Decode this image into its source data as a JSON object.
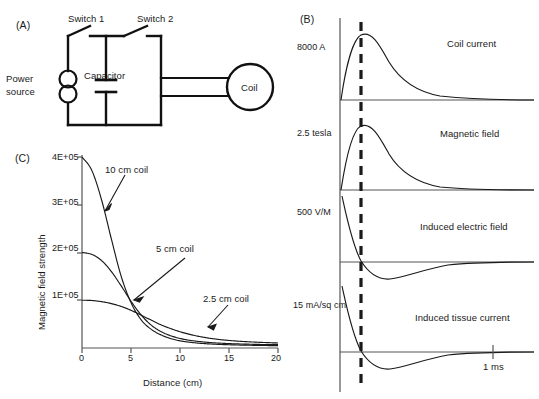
{
  "figure": {
    "panels": [
      {
        "id": "A",
        "label": "(A)"
      },
      {
        "id": "B",
        "label": "(B)"
      },
      {
        "id": "C",
        "label": "(C)"
      }
    ]
  },
  "panel_a": {
    "label": "(A)",
    "title": "TMS stimulator circuit diagram",
    "components": {
      "switch1": "Switch 1",
      "switch2": "Switch 2",
      "power_source": "Power",
      "power_source_line2": "source",
      "capacitor": "Capacitor",
      "coil": "Coil"
    }
  },
  "panel_b": {
    "label": "(B)",
    "time_axis_label": "1 ms",
    "traces": [
      {
        "name": "Coil current",
        "scale_label": "8000 A",
        "shape": "positive-damped-pulse"
      },
      {
        "name": "Magnetic field",
        "scale_label": "2.5 tesla",
        "shape": "positive-damped-pulse"
      },
      {
        "name": "Induced electric field",
        "scale_label": "500 V/M",
        "shape": "biphasic-derivative"
      },
      {
        "name": "Induced tissue current",
        "scale_label": "15 mA/sq cm",
        "shape": "biphasic-derivative"
      }
    ],
    "marker": {
      "type": "dashed-vertical-line",
      "meaning": "peak of coil current / zero-crossing of induced field"
    }
  },
  "panel_c": {
    "label": "(C)",
    "annotations": [
      {
        "text": "10 cm coil"
      },
      {
        "text": "5 cm coil"
      },
      {
        "text": "2.5 cm coil"
      }
    ]
  },
  "chart_data": {
    "type": "line",
    "title": "",
    "xlabel": "Distance (cm)",
    "ylabel": "Magnetic field strength",
    "xlim": [
      0,
      20
    ],
    "ylim": [
      0,
      400000
    ],
    "xticks": [
      0,
      5,
      10,
      15,
      20
    ],
    "xticklabels": [
      "0",
      "5",
      "10",
      "15",
      "20"
    ],
    "yticks": [
      100000,
      200000,
      300000,
      400000
    ],
    "yticklabels": [
      "1E+05",
      "2E+05",
      "3E+05",
      "4E+05"
    ],
    "grid": false,
    "legend": "inline-annotations",
    "x": [
      0,
      1,
      2,
      3,
      4,
      5,
      6,
      7,
      8,
      9,
      10,
      11,
      12,
      13,
      14,
      15,
      16,
      17,
      18,
      19,
      20
    ],
    "series": [
      {
        "name": "10 cm coil",
        "values": [
          400000,
          372000,
          310000,
          228000,
          150000,
          95000,
          60000,
          40000,
          28000,
          20000,
          15000,
          12000,
          10000,
          8500,
          7500,
          6800,
          6200,
          5800,
          5400,
          5100,
          5000
        ]
      },
      {
        "name": "5 cm coil",
        "values": [
          200000,
          196000,
          183000,
          160000,
          130000,
          98000,
          70000,
          49000,
          35000,
          26000,
          20000,
          16000,
          13500,
          11500,
          10200,
          9200,
          8500,
          8000,
          7500,
          7200,
          7000
        ]
      },
      {
        "name": "2.5 cm coil",
        "values": [
          100000,
          99500,
          97000,
          93000,
          87000,
          79000,
          69000,
          59000,
          49000,
          41000,
          34000,
          28500,
          24000,
          20500,
          17800,
          15800,
          14200,
          13000,
          12000,
          11200,
          10500
        ]
      }
    ]
  }
}
